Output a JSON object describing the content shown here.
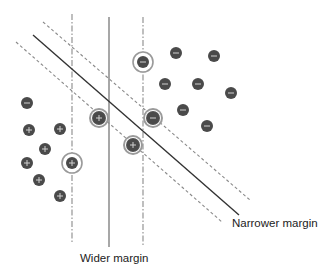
{
  "diagram": {
    "title": "",
    "labels": {
      "wider_margin": "Wider margin",
      "narrower_margin": "Narrower margin"
    },
    "colors": {
      "point_fill": "#4a4a4a",
      "glyph": "#d0d0d0",
      "line_dark": "#333333",
      "line_gray": "#8a8a8a",
      "halo": "#9a9a9a"
    },
    "lines": {
      "vertical_solid": {
        "x": 109,
        "y1": 17,
        "y2": 247,
        "style": "solid"
      },
      "vertical_left_margin": {
        "x": 72,
        "y1": 14,
        "y2": 244,
        "style": "dash-dot"
      },
      "vertical_right_margin": {
        "x": 143,
        "y1": 17,
        "y2": 246,
        "style": "dash-dot"
      },
      "diagonal_solid": {
        "x1": 33,
        "y1": 35,
        "x2": 239,
        "y2": 215,
        "style": "solid"
      },
      "diagonal_upper_margin": {
        "x1": 43,
        "y1": 22,
        "x2": 250,
        "y2": 200,
        "style": "dashed"
      },
      "diagonal_lower_margin": {
        "x1": 16,
        "y1": 42,
        "x2": 222,
        "y2": 222,
        "style": "dashed"
      }
    },
    "points": [
      {
        "cls": "minus",
        "x": 176,
        "y": 53
      },
      {
        "cls": "minus",
        "x": 214,
        "y": 56
      },
      {
        "cls": "minus",
        "x": 165,
        "y": 84
      },
      {
        "cls": "minus",
        "x": 198,
        "y": 84
      },
      {
        "cls": "minus",
        "x": 231,
        "y": 93
      },
      {
        "cls": "minus",
        "x": 183,
        "y": 110
      },
      {
        "cls": "minus",
        "x": 207,
        "y": 126
      },
      {
        "cls": "minus",
        "x": 27,
        "y": 103
      },
      {
        "cls": "plus",
        "x": 29,
        "y": 130
      },
      {
        "cls": "plus",
        "x": 60,
        "y": 129
      },
      {
        "cls": "plus",
        "x": 45,
        "y": 149
      },
      {
        "cls": "plus",
        "x": 27,
        "y": 163
      },
      {
        "cls": "plus",
        "x": 39,
        "y": 180
      },
      {
        "cls": "plus",
        "x": 60,
        "y": 196
      }
    ],
    "support_vectors_wide": [
      {
        "cls": "minus",
        "x": 143,
        "y": 62
      },
      {
        "cls": "plus",
        "x": 72,
        "y": 163
      }
    ],
    "support_vectors_narrow": [
      {
        "cls": "plus",
        "x": 99,
        "y": 118
      },
      {
        "cls": "minus",
        "x": 153,
        "y": 118
      },
      {
        "cls": "plus",
        "x": 133,
        "y": 145
      }
    ],
    "glyphs": {
      "plus": "+",
      "minus": "−"
    }
  }
}
